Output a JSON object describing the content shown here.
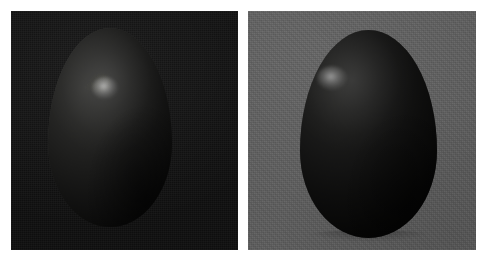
{
  "figure": {
    "kind": "photographic-comparison",
    "panel_count": 2,
    "canvas": {
      "width": 487,
      "height": 261,
      "background_color": "#ffffff"
    }
  },
  "panels": [
    {
      "id": "panel-dark",
      "name": "left-panel",
      "subject": "egg",
      "backdrop_label": "dark backdrop",
      "backdrop_color": "#0e0e0e",
      "bounds": {
        "x": 11,
        "y": 11,
        "width": 227,
        "height": 239
      },
      "object": {
        "name": "egg",
        "bounds": {
          "x": 48,
          "y": 28,
          "width": 124,
          "height": 199
        },
        "lit_color": "#6a6a66",
        "mid_color": "#373735",
        "shadow_color": "#050505",
        "highlight": {
          "name": "specular-highlight",
          "x": 105,
          "y": 88,
          "color": "#d8d8d8"
        },
        "light_direction": "upper-left"
      }
    },
    {
      "id": "panel-grey",
      "name": "right-panel",
      "subject": "egg",
      "backdrop_label": "grey backdrop",
      "backdrop_color": "#5b5b5b",
      "bounds": {
        "x": 248,
        "y": 11,
        "width": 228,
        "height": 239
      },
      "object": {
        "name": "egg",
        "bounds": {
          "x": 300,
          "y": 30,
          "width": 137,
          "height": 208
        },
        "lit_color": "#4c4c49",
        "mid_color": "#2a2a29",
        "shadow_color": "#020202",
        "highlight": {
          "name": "specular-highlight",
          "x": 332,
          "y": 78,
          "color": "#bdbdbd"
        },
        "light_direction": "upper-left"
      }
    }
  ]
}
